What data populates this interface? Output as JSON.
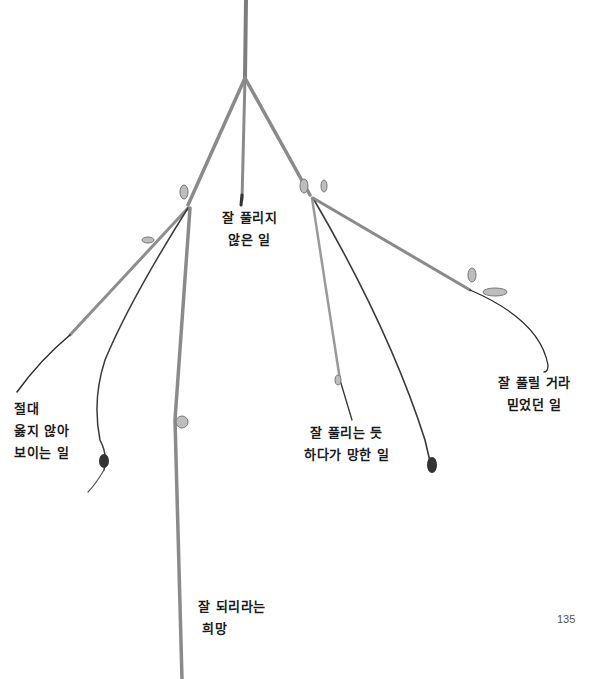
{
  "page": {
    "number": "135"
  },
  "labels": {
    "center": {
      "line1": "잘 풀리지",
      "line2": "않은 일"
    },
    "left": {
      "line1": "절대",
      "line2": "옳지 않아",
      "line3": "보이는 일"
    },
    "middle_right": {
      "line1": "잘 풀리는 듯",
      "line2": "하다가 망한 일"
    },
    "far_right": {
      "line1": "잘 풀릴 거라",
      "line2": "믿었던 일"
    },
    "bottom": {
      "line1": "잘 되리라는",
      "line2": "희망"
    }
  },
  "colors": {
    "stem": "#8a8a8a",
    "stem_dark": "#3a3a3a",
    "text": "#1a1a1a",
    "background": "#ffffff"
  }
}
